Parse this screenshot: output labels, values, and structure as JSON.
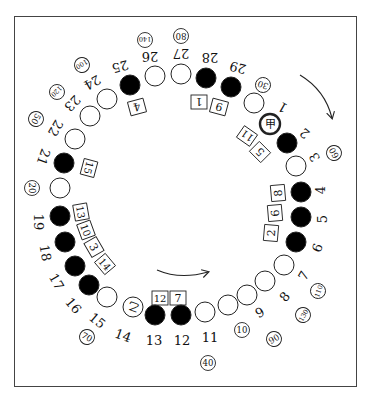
{
  "diagram": {
    "colors": {
      "black_stone": "#000000",
      "white_stone": "#ffffff",
      "stroke": "#222222",
      "frame": "#444444"
    },
    "positions": [
      {
        "n": "1",
        "x": 270,
        "y": 124,
        "fill": "white",
        "mark": "甲",
        "thick": true,
        "lx": 283,
        "ly": 107,
        "rot": 210
      },
      {
        "n": "2",
        "x": 287,
        "y": 143,
        "fill": "black",
        "lx": 305,
        "ly": 133,
        "rot": 220
      },
      {
        "n": "3",
        "x": 296,
        "y": 166,
        "fill": "white",
        "lx": 315,
        "ly": 157,
        "rot": 240
      },
      {
        "n": "4",
        "x": 301,
        "y": 192,
        "fill": "black",
        "lx": 321,
        "ly": 190,
        "rot": 270
      },
      {
        "n": "5",
        "x": 301,
        "y": 217,
        "fill": "black",
        "lx": 323,
        "ly": 219,
        "rot": 270
      },
      {
        "n": "6",
        "x": 296,
        "y": 242,
        "fill": "black",
        "lx": 318,
        "ly": 248,
        "rot": 290
      },
      {
        "n": "7",
        "x": 284,
        "y": 265,
        "fill": "white",
        "lx": 304,
        "ly": 276,
        "rot": 300
      },
      {
        "n": "8",
        "x": 265,
        "y": 281,
        "fill": "white",
        "lx": 285,
        "ly": 297,
        "rot": 310
      },
      {
        "n": "9",
        "x": 247,
        "y": 295,
        "fill": "white",
        "lx": 260,
        "ly": 313,
        "rot": 330
      },
      {
        "n": "10",
        "x": 228,
        "y": 305,
        "fill": "white",
        "lx": 0,
        "ly": 0,
        "rot": 0,
        "circled_label": true
      },
      {
        "n": "11",
        "x": 205,
        "y": 312,
        "fill": "white",
        "lx": 210,
        "ly": 338,
        "rot": 0
      },
      {
        "n": "12",
        "x": 181,
        "y": 315,
        "fill": "black",
        "lx": 182,
        "ly": 341,
        "rot": 0
      },
      {
        "n": "13",
        "x": 155,
        "y": 315,
        "fill": "black",
        "lx": 154,
        "ly": 341,
        "rot": 0
      },
      {
        "n": "14",
        "x": 133,
        "y": 307,
        "fill": "white",
        "mark": "乙",
        "lx": 123,
        "ly": 336,
        "rot": 20
      },
      {
        "n": "15",
        "x": 107,
        "y": 297,
        "fill": "white",
        "lx": 97,
        "ly": 321,
        "rot": 40
      },
      {
        "n": "16",
        "x": 89,
        "y": 285,
        "fill": "black",
        "lx": 73,
        "ly": 306,
        "rot": 50
      },
      {
        "n": "17",
        "x": 75,
        "y": 266,
        "fill": "black",
        "lx": 56,
        "ly": 282,
        "rot": 60
      },
      {
        "n": "18",
        "x": 65,
        "y": 242,
        "fill": "black",
        "lx": 45,
        "ly": 253,
        "rot": 80
      },
      {
        "n": "19",
        "x": 60,
        "y": 216,
        "fill": "black",
        "lx": 38,
        "ly": 222,
        "rot": 90
      },
      {
        "n": "20",
        "x": 60,
        "y": 188,
        "fill": "white",
        "lx": 0,
        "ly": 0,
        "rot": 0,
        "circled_label": true
      },
      {
        "n": "21",
        "x": 64,
        "y": 163,
        "fill": "black",
        "lx": 43,
        "ly": 157,
        "rot": 110
      },
      {
        "n": "22",
        "x": 75,
        "y": 139,
        "fill": "white",
        "lx": 55,
        "ly": 128,
        "rot": 120
      },
      {
        "n": "23",
        "x": 90,
        "y": 116,
        "fill": "white",
        "lx": 72,
        "ly": 103,
        "rot": 135
      },
      {
        "n": "24",
        "x": 107,
        "y": 99,
        "fill": "white",
        "lx": 92,
        "ly": 82,
        "rot": 150
      },
      {
        "n": "25",
        "x": 130,
        "y": 85,
        "fill": "black",
        "lx": 120,
        "ly": 66,
        "rot": 165
      },
      {
        "n": "26",
        "x": 155,
        "y": 76,
        "fill": "white",
        "lx": 150,
        "ly": 56,
        "rot": 180
      },
      {
        "n": "27",
        "x": 181,
        "y": 74,
        "fill": "white",
        "lx": 181,
        "ly": 53,
        "rot": 180
      },
      {
        "n": "28",
        "x": 206,
        "y": 78,
        "fill": "black",
        "lx": 210,
        "ly": 57,
        "rot": 180
      },
      {
        "n": "29",
        "x": 231,
        "y": 87,
        "fill": "black",
        "lx": 238,
        "ly": 67,
        "rot": 195
      },
      {
        "n": "30",
        "x": 254,
        "y": 103,
        "fill": "white",
        "lx": 0,
        "ly": 0,
        "rot": 0,
        "circled_label": true
      }
    ],
    "circled_tags": [
      {
        "text": "30",
        "x": 263,
        "y": 85,
        "rot": 200
      },
      {
        "text": "80",
        "x": 181,
        "y": 36,
        "rot": 180
      },
      {
        "text": "140",
        "x": 145,
        "y": 40,
        "rot": 180
      },
      {
        "text": "100",
        "x": 82,
        "y": 65,
        "rot": 150
      },
      {
        "text": "120",
        "x": 57,
        "y": 92,
        "rot": 135
      },
      {
        "text": "50",
        "x": 36,
        "y": 119,
        "rot": 120
      },
      {
        "text": "20",
        "x": 32,
        "y": 188,
        "rot": 90
      },
      {
        "text": "70",
        "x": 87,
        "y": 337,
        "rot": 30
      },
      {
        "text": "40",
        "x": 208,
        "y": 363,
        "rot": 0
      },
      {
        "text": "10",
        "x": 242,
        "y": 330,
        "rot": 0
      },
      {
        "text": "90",
        "x": 274,
        "y": 339,
        "rot": 330
      },
      {
        "text": "130",
        "x": 303,
        "y": 315,
        "rot": 300
      },
      {
        "text": "110",
        "x": 318,
        "y": 291,
        "rot": 290
      },
      {
        "text": "60",
        "x": 334,
        "y": 153,
        "rot": 240
      }
    ],
    "boxes": [
      {
        "text": "4",
        "x": 137,
        "y": 107,
        "rot": 165
      },
      {
        "text": "1",
        "x": 199,
        "y": 102,
        "rot": 180
      },
      {
        "text": "9",
        "x": 219,
        "y": 107,
        "rot": 195
      },
      {
        "text": "11",
        "x": 247,
        "y": 136,
        "rot": 215
      },
      {
        "text": "5",
        "x": 260,
        "y": 152,
        "rot": 225
      },
      {
        "text": "15",
        "x": 89,
        "y": 168,
        "rot": 105
      },
      {
        "text": "8",
        "x": 278,
        "y": 193,
        "rot": 265
      },
      {
        "text": "6",
        "x": 275,
        "y": 213,
        "rot": 265
      },
      {
        "text": "2",
        "x": 271,
        "y": 233,
        "rot": 275
      },
      {
        "text": "13",
        "x": 81,
        "y": 212,
        "rot": 80
      },
      {
        "text": "10",
        "x": 86,
        "y": 230,
        "rot": 70
      },
      {
        "text": "3",
        "x": 94,
        "y": 247,
        "rot": 60
      },
      {
        "text": "14",
        "x": 105,
        "y": 264,
        "rot": 50
      },
      {
        "text": "12",
        "x": 160,
        "y": 298,
        "rot": 0
      },
      {
        "text": "7",
        "x": 178,
        "y": 298,
        "rot": 0
      }
    ],
    "arrows": [
      {
        "name": "clockwise-arrow-top-right",
        "path": "M 300 75 Q 325 90 332 118",
        "head": "332,118"
      },
      {
        "name": "clockwise-arrow-bottom",
        "path": "M 157 270 Q 180 280 208 272",
        "head": "208,272"
      }
    ]
  }
}
